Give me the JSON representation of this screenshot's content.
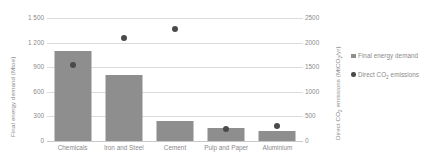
{
  "chart_data": {
    "type": "bar",
    "title": "",
    "xlabel": "",
    "ylabel": "Final energy demand (Mtoe)",
    "y2label": "Direct CO2 emissions (MtCO2/yr)",
    "categories": [
      "Chemicals",
      "Iron and Steel",
      "Cement",
      "Pulp and Paper",
      "Aluminium"
    ],
    "grid": true,
    "legend_position": "right",
    "series": [
      {
        "name": "Final energy demand",
        "type": "bar",
        "axis": "left",
        "unit": "Mtoe",
        "color": "#8e8e8e",
        "values": [
          1100,
          805,
          245,
          160,
          120
        ]
      },
      {
        "name": "Direct CO2 emissions",
        "type": "scatter",
        "axis": "right",
        "unit": "MtCO2/yr",
        "color": "#4a4a4a",
        "values": [
          1545,
          2090,
          2275,
          250,
          310
        ]
      }
    ],
    "yaxis_left": {
      "min": 0,
      "max": 1500,
      "ticks": [
        0,
        300,
        600,
        900,
        1200,
        1500
      ],
      "tick_labels": [
        "0",
        "300",
        "600",
        "900",
        "1 200",
        "1 500"
      ]
    },
    "yaxis_right": {
      "min": 0,
      "max": 2500,
      "ticks": [
        0,
        500,
        1000,
        1500,
        2000,
        2500
      ],
      "tick_labels": [
        "0",
        "500",
        "1000",
        "1500",
        "2000",
        "2500"
      ]
    }
  },
  "axis_titles": {
    "left_pre": "Final energy demand (Mtoe)",
    "right_pre": "Direct CO",
    "right_sub": "2",
    "right_post": " emissions (MtCO",
    "right_sub2": "2",
    "right_post2": "/yr)"
  },
  "legend": {
    "items": [
      {
        "label": "Final energy demand",
        "marker": "square",
        "color": "#8e8e8e"
      },
      {
        "label_pre": "Direct CO",
        "label_sub": "2",
        "label_post": " emissions",
        "marker": "circle",
        "color": "#4a4a4a"
      }
    ]
  }
}
